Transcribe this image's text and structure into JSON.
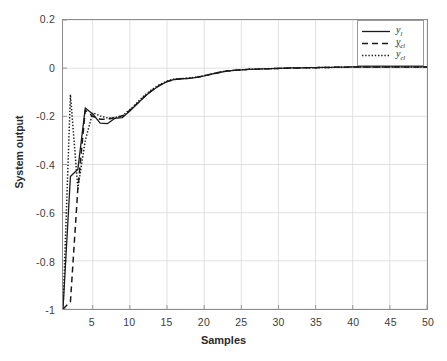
{
  "figure": {
    "background": "#ffffff",
    "axis_color": "#8d8d8d",
    "grid_color": "#d9d9d9",
    "line_color": "#1a1a1a",
    "tick_text_color": "#3c3c3c"
  },
  "axes": {
    "xlabel": "Samples",
    "ylabel": "System output",
    "xticks": [
      "5",
      "10",
      "15",
      "20",
      "25",
      "30",
      "35",
      "40",
      "45",
      "50"
    ],
    "xtick_values": [
      5,
      10,
      15,
      20,
      25,
      30,
      35,
      40,
      45,
      50
    ],
    "yticks": [
      "0.2",
      "0",
      "-0.2",
      "-0.4",
      "-0.6",
      "-0.8",
      "-1"
    ],
    "ytick_values": [
      0.2,
      0,
      -0.2,
      -0.4,
      -0.6,
      -0.8,
      -1
    ]
  },
  "legend": {
    "position": "top-right",
    "items": [
      {
        "label": "y",
        "sub": "l",
        "hat": false,
        "style": "solid",
        "name": "legend-item-yl"
      },
      {
        "label": "y",
        "sub": "cl",
        "hat": false,
        "style": "dashed",
        "name": "legend-item-ycl"
      },
      {
        "label": "y",
        "sub": "cl",
        "hat": true,
        "style": "dotted",
        "name": "legend-item-yclhat"
      }
    ]
  },
  "chart_data": {
    "type": "line",
    "title": "",
    "xlabel": "Samples",
    "ylabel": "System output",
    "xlim": [
      1,
      50
    ],
    "ylim": [
      -1,
      0.2
    ],
    "grid": true,
    "legend_position": "top-right",
    "x": [
      1,
      2,
      3,
      4,
      5,
      6,
      7,
      8,
      9,
      10,
      11,
      12,
      13,
      14,
      15,
      16,
      17,
      18,
      19,
      20,
      21,
      22,
      23,
      24,
      25,
      26,
      27,
      28,
      29,
      30,
      31,
      32,
      33,
      34,
      35,
      36,
      37,
      38,
      39,
      40,
      41,
      42,
      43,
      44,
      45,
      46,
      47,
      48,
      49,
      50
    ],
    "series": [
      {
        "name": "y_l",
        "style": "solid",
        "values": [
          -1.0,
          -0.45,
          -0.42,
          -0.165,
          -0.19,
          -0.228,
          -0.23,
          -0.208,
          -0.205,
          -0.178,
          -0.148,
          -0.118,
          -0.093,
          -0.072,
          -0.056,
          -0.047,
          -0.044,
          -0.042,
          -0.038,
          -0.032,
          -0.025,
          -0.018,
          -0.012,
          -0.009,
          -0.007,
          -0.005,
          -0.004,
          -0.003,
          -0.002,
          -0.001,
          0.0,
          0.001,
          0.001,
          0.002,
          0.002,
          0.003,
          0.003,
          0.004,
          0.004,
          0.005,
          0.005,
          0.005,
          0.005,
          0.005,
          0.005,
          0.005,
          0.005,
          0.005,
          0.005,
          0.005
        ]
      },
      {
        "name": "y_cl",
        "style": "dashed",
        "values": [
          -1.0,
          -0.97,
          -0.5,
          -0.175,
          -0.2,
          -0.212,
          -0.212,
          -0.205,
          -0.198,
          -0.175,
          -0.147,
          -0.117,
          -0.092,
          -0.071,
          -0.056,
          -0.047,
          -0.044,
          -0.042,
          -0.038,
          -0.032,
          -0.025,
          -0.018,
          -0.012,
          -0.009,
          -0.007,
          -0.005,
          -0.004,
          -0.003,
          -0.002,
          -0.001,
          0.0,
          0.001,
          0.001,
          0.002,
          0.002,
          0.003,
          0.003,
          0.004,
          0.004,
          0.005,
          0.005,
          0.005,
          0.005,
          0.005,
          0.005,
          0.005,
          0.005,
          0.005,
          0.005,
          0.005
        ]
      },
      {
        "name": "y_cl_hat",
        "style": "dotted",
        "values": [
          -1.0,
          -0.11,
          -0.5,
          -0.3,
          -0.185,
          -0.198,
          -0.207,
          -0.205,
          -0.198,
          -0.172,
          -0.143,
          -0.112,
          -0.088,
          -0.068,
          -0.054,
          -0.045,
          -0.043,
          -0.041,
          -0.037,
          -0.031,
          -0.024,
          -0.017,
          -0.012,
          -0.009,
          -0.007,
          -0.005,
          -0.004,
          -0.003,
          -0.002,
          -0.001,
          0.0,
          0.001,
          0.001,
          0.002,
          0.002,
          0.003,
          0.003,
          0.004,
          0.004,
          0.005,
          0.005,
          0.005,
          0.005,
          0.005,
          0.005,
          0.005,
          0.005,
          0.005,
          0.005,
          0.005
        ]
      }
    ]
  }
}
